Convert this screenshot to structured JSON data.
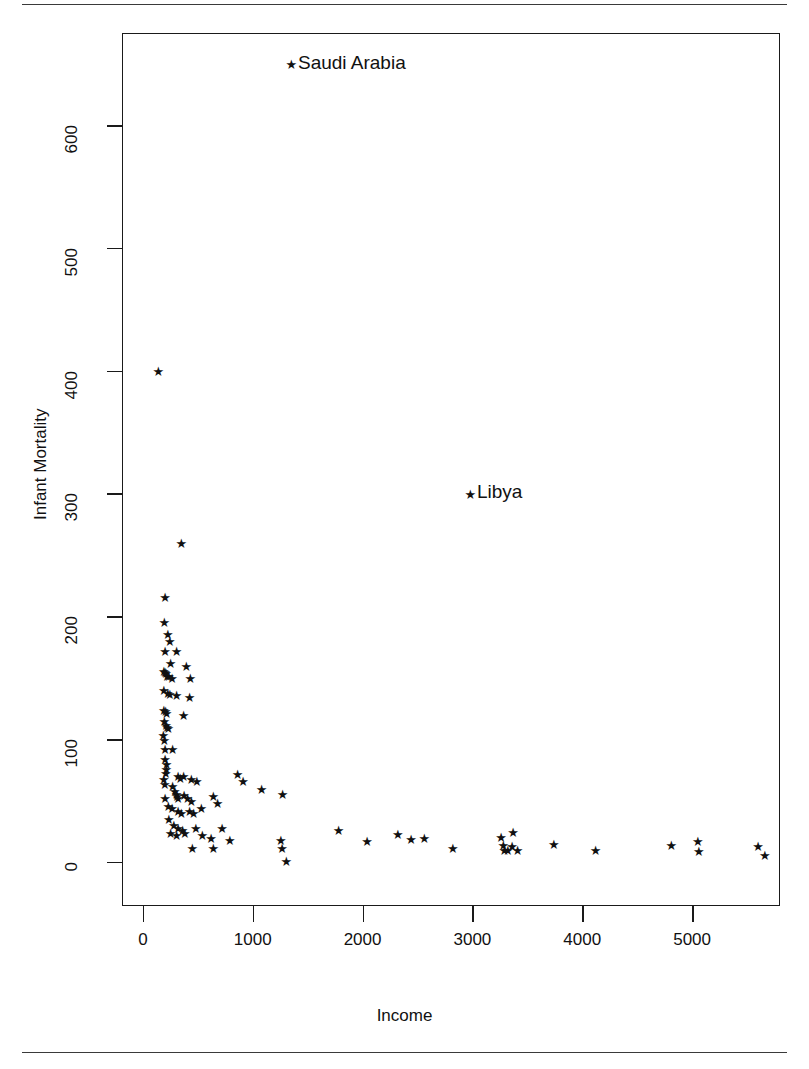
{
  "figure": {
    "rule_top": "horizontal-rule",
    "rule_bottom": "horizontal-rule"
  },
  "chart_data": {
    "type": "scatter",
    "title": "",
    "xlabel": "Income",
    "ylabel": "Infant Mortality",
    "xlim": [
      -190,
      5800
    ],
    "ylim": [
      -36,
      675
    ],
    "xticks": [
      0,
      1000,
      2000,
      3000,
      4000,
      5000
    ],
    "yticks": [
      0,
      100,
      200,
      300,
      400,
      500,
      600
    ],
    "xtick_labels": [
      "0",
      "1000",
      "2000",
      "3000",
      "4000",
      "5000"
    ],
    "ytick_labels": [
      "0",
      "100",
      "200",
      "300",
      "400",
      "500",
      "600"
    ],
    "grid": false,
    "legend": null,
    "marker": "star",
    "marker_color": "#111111",
    "annotations": [
      {
        "label": "Saudi Arabia",
        "x": 1330,
        "y": 650
      },
      {
        "label": "Libya",
        "x": 2960,
        "y": 300
      }
    ],
    "points": [
      {
        "x": 1330,
        "y": 650
      },
      {
        "x": 2960,
        "y": 300
      },
      {
        "x": 120,
        "y": 400
      },
      {
        "x": 330,
        "y": 260
      },
      {
        "x": 180,
        "y": 216
      },
      {
        "x": 175,
        "y": 196
      },
      {
        "x": 205,
        "y": 186
      },
      {
        "x": 225,
        "y": 180
      },
      {
        "x": 180,
        "y": 172
      },
      {
        "x": 285,
        "y": 172
      },
      {
        "x": 230,
        "y": 162
      },
      {
        "x": 375,
        "y": 160
      },
      {
        "x": 170,
        "y": 156
      },
      {
        "x": 180,
        "y": 155
      },
      {
        "x": 190,
        "y": 154
      },
      {
        "x": 200,
        "y": 152
      },
      {
        "x": 215,
        "y": 152
      },
      {
        "x": 245,
        "y": 150
      },
      {
        "x": 410,
        "y": 150
      },
      {
        "x": 170,
        "y": 140
      },
      {
        "x": 205,
        "y": 138
      },
      {
        "x": 225,
        "y": 137
      },
      {
        "x": 285,
        "y": 136
      },
      {
        "x": 405,
        "y": 135
      },
      {
        "x": 170,
        "y": 124
      },
      {
        "x": 185,
        "y": 123
      },
      {
        "x": 195,
        "y": 122
      },
      {
        "x": 350,
        "y": 120
      },
      {
        "x": 175,
        "y": 115
      },
      {
        "x": 190,
        "y": 112
      },
      {
        "x": 200,
        "y": 110
      },
      {
        "x": 210,
        "y": 109
      },
      {
        "x": 165,
        "y": 104
      },
      {
        "x": 175,
        "y": 100
      },
      {
        "x": 180,
        "y": 92
      },
      {
        "x": 250,
        "y": 92
      },
      {
        "x": 180,
        "y": 84
      },
      {
        "x": 195,
        "y": 80
      },
      {
        "x": 192,
        "y": 76
      },
      {
        "x": 188,
        "y": 73
      },
      {
        "x": 170,
        "y": 68
      },
      {
        "x": 178,
        "y": 64
      },
      {
        "x": 300,
        "y": 70
      },
      {
        "x": 320,
        "y": 69
      },
      {
        "x": 350,
        "y": 70
      },
      {
        "x": 420,
        "y": 68
      },
      {
        "x": 470,
        "y": 66
      },
      {
        "x": 840,
        "y": 72
      },
      {
        "x": 890,
        "y": 66
      },
      {
        "x": 1060,
        "y": 60
      },
      {
        "x": 1250,
        "y": 56
      },
      {
        "x": 250,
        "y": 62
      },
      {
        "x": 270,
        "y": 58
      },
      {
        "x": 285,
        "y": 56
      },
      {
        "x": 290,
        "y": 54
      },
      {
        "x": 300,
        "y": 52
      },
      {
        "x": 355,
        "y": 55
      },
      {
        "x": 385,
        "y": 52
      },
      {
        "x": 420,
        "y": 50
      },
      {
        "x": 620,
        "y": 54
      },
      {
        "x": 660,
        "y": 48
      },
      {
        "x": 180,
        "y": 52
      },
      {
        "x": 210,
        "y": 46
      },
      {
        "x": 245,
        "y": 44
      },
      {
        "x": 300,
        "y": 42
      },
      {
        "x": 330,
        "y": 40
      },
      {
        "x": 405,
        "y": 42
      },
      {
        "x": 440,
        "y": 40
      },
      {
        "x": 510,
        "y": 44
      },
      {
        "x": 215,
        "y": 35
      },
      {
        "x": 260,
        "y": 30
      },
      {
        "x": 300,
        "y": 28
      },
      {
        "x": 340,
        "y": 26
      },
      {
        "x": 230,
        "y": 24
      },
      {
        "x": 285,
        "y": 22
      },
      {
        "x": 360,
        "y": 24
      },
      {
        "x": 460,
        "y": 28
      },
      {
        "x": 520,
        "y": 22
      },
      {
        "x": 600,
        "y": 20
      },
      {
        "x": 700,
        "y": 28
      },
      {
        "x": 770,
        "y": 18
      },
      {
        "x": 620,
        "y": 12
      },
      {
        "x": 430,
        "y": 12
      },
      {
        "x": 1235,
        "y": 18
      },
      {
        "x": 1245,
        "y": 12
      },
      {
        "x": 1285,
        "y": 1
      },
      {
        "x": 1760,
        "y": 26
      },
      {
        "x": 2020,
        "y": 17
      },
      {
        "x": 2300,
        "y": 23
      },
      {
        "x": 2420,
        "y": 19
      },
      {
        "x": 2540,
        "y": 20
      },
      {
        "x": 2800,
        "y": 12
      },
      {
        "x": 3240,
        "y": 21
      },
      {
        "x": 3260,
        "y": 14
      },
      {
        "x": 3270,
        "y": 10
      },
      {
        "x": 3300,
        "y": 10
      },
      {
        "x": 3340,
        "y": 13
      },
      {
        "x": 3350,
        "y": 25
      },
      {
        "x": 3390,
        "y": 10
      },
      {
        "x": 3720,
        "y": 15
      },
      {
        "x": 4100,
        "y": 10
      },
      {
        "x": 4790,
        "y": 14
      },
      {
        "x": 5030,
        "y": 17
      },
      {
        "x": 5040,
        "y": 9
      },
      {
        "x": 5580,
        "y": 13
      },
      {
        "x": 5640,
        "y": 6
      }
    ]
  }
}
